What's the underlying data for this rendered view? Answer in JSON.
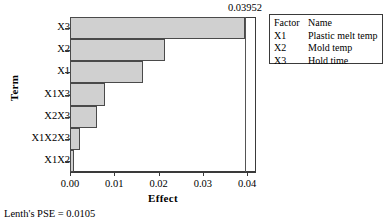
{
  "chart_data": {
    "type": "bar",
    "orientation": "horizontal",
    "title": "",
    "xlabel": "Effect",
    "ylabel": "Term",
    "categories": [
      "X3",
      "X2",
      "X1",
      "X1X3",
      "X2X3",
      "X1X2X3",
      "X1X2"
    ],
    "values": [
      0.0395,
      0.0215,
      0.0165,
      0.008,
      0.006,
      0.0023,
      0.0008
    ],
    "xlim": [
      0.0,
      0.042
    ],
    "xticks": [
      "0.00",
      "0.01",
      "0.02",
      "0.03",
      "0.04"
    ],
    "xtick_values": [
      0.0,
      0.01,
      0.02,
      0.03,
      0.04
    ],
    "grid": false,
    "legend_position": "top-right",
    "reference_line": {
      "value": 0.03952,
      "label": "0.03952"
    },
    "bar_fill_color": "#d0d0d0",
    "bar_edge_color": "#4a4a4a",
    "axis_color": "#3a3a3a"
  },
  "legend": {
    "headers": [
      "Factor",
      "Name"
    ],
    "rows": [
      {
        "code": "X1",
        "name": "Plastic melt temp"
      },
      {
        "code": "X2",
        "name": "Mold temp"
      },
      {
        "code": "X3",
        "name": "Hold time"
      }
    ]
  },
  "footer": {
    "note": "Lenth's PSE = 0.0105"
  }
}
